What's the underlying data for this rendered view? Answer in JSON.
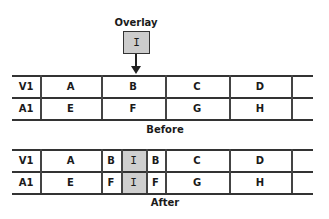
{
  "overlay": {
    "title": "Overlay",
    "clip": "I",
    "fill_color": "#cccccc"
  },
  "before": {
    "caption": "Before",
    "tracks": [
      {
        "label": "V1",
        "clips": [
          "A",
          "B",
          "C",
          "D",
          ""
        ]
      },
      {
        "label": "A1",
        "clips": [
          "E",
          "F",
          "G",
          "H",
          ""
        ]
      }
    ]
  },
  "after": {
    "caption": "After",
    "tracks": [
      {
        "label": "V1",
        "clips": [
          "A",
          "B",
          "I",
          "B",
          "C",
          "D",
          ""
        ]
      },
      {
        "label": "A1",
        "clips": [
          "E",
          "F",
          "I",
          "F",
          "G",
          "H",
          ""
        ]
      }
    ]
  }
}
